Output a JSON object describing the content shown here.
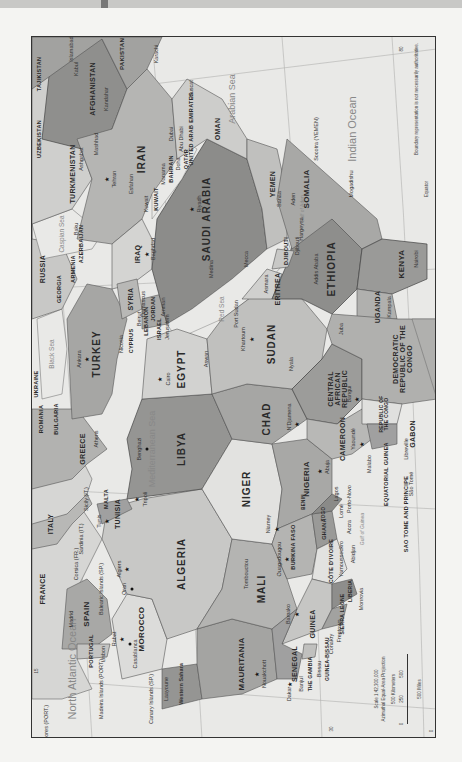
{
  "map": {
    "title": "North Africa and Southwest Asia political map",
    "colors": {
      "water": "#e9e9e7",
      "land_light": "#dcdcda",
      "land_mid": "#b9b9b7",
      "land_dark": "#9a9a98",
      "border": "#555555"
    },
    "seas": {
      "mediterranean": "Mediterranean Sea",
      "black": "Black Sea",
      "caspian": "Caspian Sea",
      "red": "Red Sea",
      "arabian": "Arabian Sea",
      "indian": "Indian Ocean",
      "north_atlantic": "North Atlantic Ocean",
      "gulf_aden": "Gulf of Aden",
      "gulf_guinea": "Gulf of Guinea"
    },
    "countries": {
      "algeria": "ALGERIA",
      "libya": "LIBYA",
      "egypt": "EGYPT",
      "sudan": "SUDAN",
      "chad": "CHAD",
      "niger": "NIGER",
      "mali": "MALI",
      "mauritania": "MAURITANIA",
      "morocco": "MOROCCO",
      "western_sahara": "Western Sahara",
      "tunisia": "TUNISIA",
      "nigeria": "NIGERIA",
      "cameroon": "CAMEROON",
      "car": "CENTRAL AFRICAN REPUBLIC",
      "drc": "DEMOCRATIC REPUBLIC OF THE CONGO",
      "congo": "REPUBLIC OF THE CONGO",
      "gabon": "GABON",
      "eq_guinea": "EQUATORIAL GUINEA",
      "sao_tome": "SAO TOME AND PRINCIPE",
      "ethiopia": "ETHIOPIA",
      "eritrea": "ERITREA",
      "djibouti": "DJIBOUTI",
      "somalia": "SOMALIA",
      "kenya": "KENYA",
      "uganda": "UGANDA",
      "saudi": "SAUDI ARABIA",
      "yemen": "YEMEN",
      "oman": "OMAN",
      "uae": "UNITED ARAB EMIRATES",
      "qatar": "QATAR",
      "bahrain": "BAHRAIN",
      "kuwait": "KUWAIT",
      "iraq": "IRAQ",
      "iran": "IRAN",
      "syria": "SYRIA",
      "jordan": "JORDAN",
      "israel": "ISRAEL",
      "lebanon": "LEBANON",
      "cyprus": "CYPRUS",
      "turkey": "TURKEY",
      "georgia": "GEORGIA",
      "armenia": "ARMENIA",
      "azerbaijan": "AZERBAIJAN",
      "russia": "RUSSIA",
      "turkmenistan": "TURKMENISTAN",
      "uzbekistan": "UZBEKISTAN",
      "tajikistan": "TAJIKISTAN",
      "afghanistan": "AFGHANISTAN",
      "pakistan": "PAKISTAN",
      "greece": "GREECE",
      "bulgaria": "BULGARIA",
      "romania": "ROMANIA",
      "ukraine": "UKRAINE",
      "italy": "ITALY",
      "malta": "MALTA",
      "france": "FRANCE",
      "spain": "SPAIN",
      "portugal": "PORTUGAL",
      "senegal": "SENEGAL",
      "gambia": "THE GAMBIA",
      "guinea_bissau": "GUINEA-BISSAU",
      "guinea": "GUINEA",
      "sierra_leone": "SIERRA LEONE",
      "liberia": "LIBERIA",
      "cote_divoire": "CÔTE D'IVOIRE",
      "burkina": "BURKINA FASO",
      "ghana": "GHANA",
      "togo": "TOGO",
      "benin": "BENIN"
    },
    "cities": {
      "cairo": "Cairo",
      "tripoli": "Tripoli",
      "benghazi": "Benghazi",
      "algiers": "Algiers",
      "oran": "Oran",
      "tunis": "Tunis",
      "rabat": "Rabat",
      "casablanca": "Casablanca",
      "laayoune": "Laayoune",
      "nouakchott": "Nouakchott",
      "dakar": "Dakar",
      "banjul": "Banjul",
      "bissau": "Bissau",
      "conakry": "Conakry",
      "freetown": "Freetown",
      "monrovia": "Monrovia",
      "yamoussoukro": "Yamoussoukro",
      "abidjan": "Abidjan",
      "accra": "Accra",
      "lome": "Lomé",
      "porto_novo": "Porto-Novo",
      "lagos": "Lagos",
      "abuja": "Abuja",
      "niamey": "Niamey",
      "bamako": "Bamako",
      "ouagadougou": "Ouagadougou",
      "tombouctou": "Tombouctou",
      "ndjamena": "N'Djamena",
      "yaounde": "Yaoundé",
      "malabo": "Malabo",
      "sao_tome": "São Tomé",
      "libreville": "Libreville",
      "bangui": "Bangui",
      "khartoum": "Khartoum",
      "nyala": "Nyala",
      "juba": "Juba",
      "port_sudan": "Port Sudan",
      "aswan": "Aswan",
      "asmara": "Asmara",
      "addis": "Addis Ababa",
      "djibouti": "Djibouti",
      "hargeysa": "Hargeysa",
      "mogadishu": "Mogadishu",
      "nairobi": "Nairobi",
      "kampala": "Kampala",
      "sanaa": "Sanaa",
      "aden": "Aden",
      "mecca": "Mecca",
      "medina": "Medina",
      "riyadh": "Riyadh",
      "manama": "Manama",
      "doha": "Doha",
      "abu_dhabi": "Abu Dhabi",
      "dubai": "Dubai",
      "muscat": "Muscat",
      "kuwait": "Kuwait",
      "baghdad": "Baghdad",
      "tehran": "Tehran",
      "esfahan": "Esfahan",
      "mashhad": "Mashhad",
      "ashgabat": "Ashgabat",
      "baku": "Baku",
      "kabul": "Kabul",
      "kandahar": "Kandahar",
      "islamabad": "Islamabad",
      "karachi": "Karachi",
      "ankara": "Ankara",
      "nicosia": "Nicosia",
      "beirut": "Beirut",
      "damascus": "Damascus",
      "jerusalem": "Jerusalem",
      "amman": "Amman",
      "athens": "Athens",
      "madrid": "Madrid",
      "lisbon": "Lisbon"
    },
    "islands": {
      "canary": "Canary Islands (SP.)",
      "madeira": "Madeira Islands (PORT.)",
      "azores": "Azores (PORT.)",
      "balearic": "Balearic Islands (SP.)",
      "corsica": "Corsica (FR.)",
      "sardinia": "Sardinia (IT.)",
      "sicily": "Sicily (IT.)",
      "socotra": "Socotra (YEMEN)"
    },
    "graticule": {
      "lon_80": "80",
      "lon_15": "15",
      "lat_30": "30",
      "lat_0": "0",
      "equator": "Equator"
    },
    "scale": {
      "ratio": "Scale 1:42,300,000",
      "projection": "Azimuthal Equal-Area Projection",
      "km_label": "500 Kilometers",
      "mi_label": "500 Miles",
      "ticks": [
        "0",
        "250",
        "500"
      ]
    },
    "disclaimer": "Boundary representation is not necessarily authoritative."
  }
}
